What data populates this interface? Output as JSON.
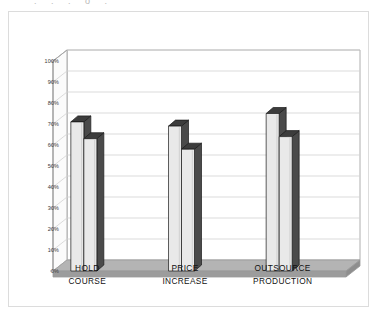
{
  "figure": {
    "caption_remnant": ". .        .              o                    .",
    "frame_color": "#dcdcdc",
    "background": "#ffffff"
  },
  "chart_data": {
    "type": "bar",
    "title": "",
    "subtitle": "",
    "xlabel": "",
    "ylabel": "",
    "categories": [
      "HOLD COURSE",
      "PRICE INCREASE",
      "OUTSOURCE PRODUCTION"
    ],
    "category_lines": [
      [
        "HOLD",
        "COURSE"
      ],
      [
        "PRICE",
        "INCREASE"
      ],
      [
        "OUTSOURCE",
        "PRODUCTION"
      ]
    ],
    "series": [
      {
        "name": "Series 1",
        "values": [
          71,
          69,
          75
        ]
      },
      {
        "name": "Series 2",
        "values": [
          63,
          58,
          64
        ]
      }
    ],
    "value_unit": "%",
    "ylim": [
      0,
      100
    ],
    "ytick_step": 10,
    "ytick_labels": [
      "100%",
      "90%",
      "80%",
      "70%",
      "60%",
      "50%",
      "40%",
      "30%",
      "20%",
      "10%",
      "0%"
    ],
    "ytick_values": [
      100,
      90,
      80,
      70,
      60,
      50,
      40,
      30,
      20,
      10,
      0
    ],
    "grid": true,
    "grid_axis": "y",
    "legend": false,
    "legend_position": "none",
    "three_d": true,
    "annotations": [],
    "colors": {
      "bar_face": "#e9e9e9",
      "bar_side": "#4a4a4a",
      "bar_top": "#3c3c3c",
      "bar_outline": "#1a1a1a",
      "gridline": "#d2d2d2",
      "axis": "#9a9a9a",
      "floor": "#9c9c9c",
      "floor_top": "#b4b4b4",
      "text": "#111111",
      "tick_text": "#3a3a3a"
    }
  }
}
